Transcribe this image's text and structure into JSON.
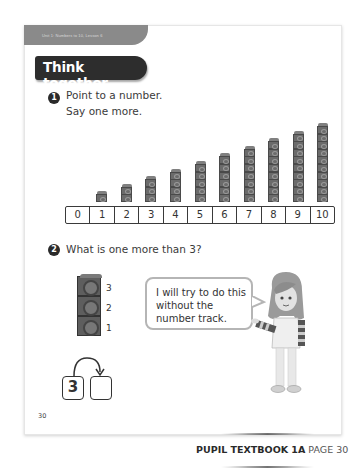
{
  "header": {
    "unit_label": "Unit 1: Numbers to 10, Lesson 6",
    "section_title": "Think together"
  },
  "question1": {
    "number": "1",
    "line1": "Point to a number.",
    "line2": "Say one more."
  },
  "cube_towers": {
    "heights": [
      1,
      2,
      3,
      4,
      5,
      6,
      7,
      8,
      9,
      10
    ]
  },
  "number_track": {
    "cells": [
      "0",
      "1",
      "2",
      "3",
      "4",
      "5",
      "6",
      "7",
      "8",
      "9",
      "10"
    ]
  },
  "question2": {
    "number": "2",
    "text": "What is one more than 3?",
    "stack_labels": [
      "3",
      "2",
      "1"
    ],
    "speech_bubble": "I will try to do this without the number track.",
    "start_box": "3",
    "answer_box": ""
  },
  "footer": {
    "page_number": "30",
    "book_label": "PUPIL TEXTBOOK 1A",
    "page_label": "PAGE 30"
  },
  "colors": {
    "cube": "#6b6b6b",
    "pill": "#2d2d2d",
    "tab": "#8a8a8a"
  }
}
